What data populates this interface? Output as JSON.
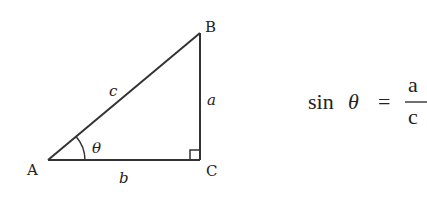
{
  "diagram": {
    "type": "right-triangle",
    "vertices": [
      {
        "id": "A",
        "label": "A",
        "x": 48,
        "y": 160
      },
      {
        "id": "B",
        "label": "B",
        "x": 200,
        "y": 33
      },
      {
        "id": "C",
        "label": "C",
        "x": 200,
        "y": 160
      }
    ],
    "sides": {
      "hypotenuse": {
        "label": "c",
        "from": "A",
        "to": "B"
      },
      "opposite": {
        "label": "a",
        "from": "B",
        "to": "C"
      },
      "adjacent": {
        "label": "b",
        "from": "A",
        "to": "C"
      }
    },
    "angle": {
      "vertex": "A",
      "label": "θ"
    },
    "right_angle_at": "C",
    "line_color": "#333333"
  },
  "formula": {
    "func": "sin",
    "variable": "θ",
    "equals": "=",
    "numerator": "a",
    "denominator": "c"
  }
}
